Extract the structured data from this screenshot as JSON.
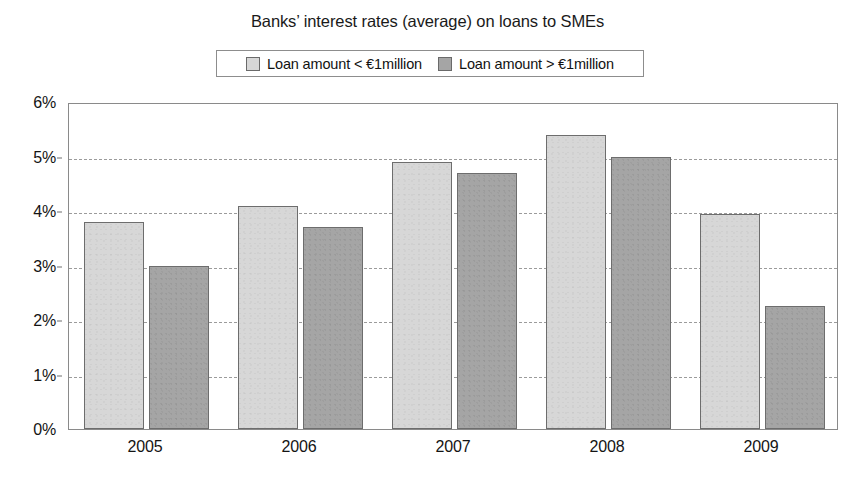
{
  "chart_data": {
    "type": "bar",
    "title": "Banks’ interest rates (average) on loans to SMEs",
    "xlabel": "",
    "ylabel": "",
    "categories": [
      "2005",
      "2006",
      "2007",
      "2008",
      "2009"
    ],
    "series": [
      {
        "name": "Loan amount < €1million",
        "color": "#d7d7d7",
        "values": [
          3.8,
          4.1,
          4.9,
          5.4,
          3.95
        ]
      },
      {
        "name": "Loan amount > €1million",
        "color": "#a5a5a5",
        "values": [
          3.0,
          3.7,
          4.7,
          5.0,
          2.25
        ]
      }
    ],
    "ylim": [
      0,
      6
    ],
    "ytick_values": [
      0,
      1,
      2,
      3,
      4,
      5,
      6
    ],
    "ytick_labels": [
      "0%",
      "1%",
      "2%",
      "3%",
      "4%",
      "5%",
      "6%"
    ],
    "grid": true,
    "grid_style": "dashed",
    "grid_color": "#9b9b9b",
    "legend_position": "top-center",
    "value_unit": "%"
  },
  "legend": {
    "entries": [
      {
        "label": "Loan amount < €1million",
        "swatch": "light"
      },
      {
        "label": "Loan amount > €1million",
        "swatch": "dark"
      }
    ]
  },
  "colors": {
    "series_light": "#d7d7d7",
    "series_dark": "#a5a5a5",
    "bar_border": "#6d6d6d",
    "axis": "#8a8a8a",
    "gridline": "#9b9b9b",
    "text": "#141414",
    "background": "#ffffff"
  }
}
